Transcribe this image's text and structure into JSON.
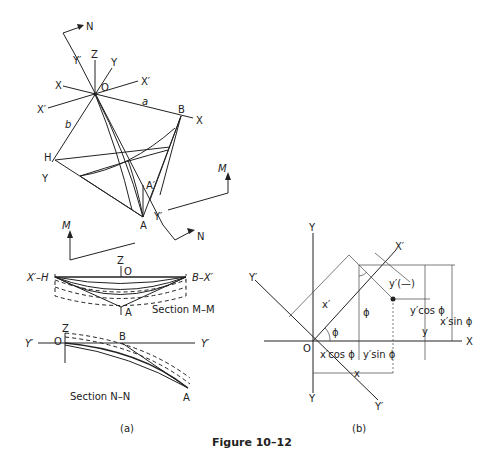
{
  "figure": {
    "caption": "Figure 10–12",
    "panel_a_label": "(a)",
    "panel_b_label": "(b)"
  },
  "panel_a": {
    "plan_view": {
      "labels": {
        "N_top": "N",
        "Y_prime_top": "Y′",
        "Z": "Z",
        "Y": "Y",
        "O": "O",
        "X_left": "X",
        "X_prime_right": "X′",
        "X_prime_left": "X′",
        "a": "a",
        "B": "B",
        "X_right": "X",
        "b": "b",
        "H": "H",
        "Y_bottom_left": "Y",
        "A_prime": "A′",
        "M_right": "M",
        "M_left": "M",
        "Y_prime_bottom": "Y′",
        "A": "A",
        "N_bottom": "N"
      }
    },
    "section_mm": {
      "title": "Section M–M",
      "labels": {
        "Z": "Z",
        "O": "O",
        "left_end": "X′–H",
        "right_end": "B–X′",
        "A": "A"
      }
    },
    "section_nn": {
      "title": "Section N–N",
      "labels": {
        "Z": "Z",
        "O": "O",
        "B": "B",
        "Y_prime_left": "Y′",
        "Y_prime_right": "Y′",
        "A": "A"
      }
    }
  },
  "panel_b": {
    "labels": {
      "Y_top": "Y",
      "X_prime": "X′",
      "Y_prime_left": "Y′",
      "y_prime_neg": "y′(—)",
      "x_prime": "x′",
      "phi_upper": "ϕ",
      "y_prime_cos": "y′cos ϕ",
      "x_prime_sin": "x′sin ϕ",
      "phi_lower": "ϕ",
      "y": "y",
      "X": "X",
      "O": "O",
      "x_prime_cos": "x′cos ϕ",
      "y_prime_sin": "y′sin ϕ",
      "x": "x",
      "Y_bottom": "Y",
      "Y_prime_bottom": "Y′"
    }
  }
}
